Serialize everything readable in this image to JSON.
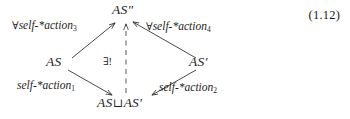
{
  "figure": {
    "kind": "commutative-diagram",
    "equation_number": "(1.12)",
    "ink_color": "#1e1e1e",
    "background_color": "#ffffff",
    "vertices": [
      {
        "id": "top",
        "text": "AS",
        "decoration": "″",
        "position": "top"
      },
      {
        "id": "left",
        "text": "AS",
        "decoration": "",
        "position": "left"
      },
      {
        "id": "right",
        "text": "AS",
        "decoration": "′",
        "position": "right"
      },
      {
        "id": "bottom",
        "text_left": "AS",
        "operator": "⊔",
        "text_right": "AS′",
        "position": "bottom"
      }
    ],
    "edges": [
      {
        "id": "top-left",
        "from": "left",
        "to": "top",
        "style": "solid",
        "quantifier": "∀",
        "label": "self-*action",
        "subscript": "3"
      },
      {
        "id": "top-right",
        "from": "right",
        "to": "top",
        "style": "solid",
        "quantifier": "∀",
        "label": "self-*action",
        "subscript": "4"
      },
      {
        "id": "bottom-left",
        "from": "left",
        "to": "bottom",
        "style": "solid",
        "quantifier": "",
        "label": "self-*action",
        "subscript": "1"
      },
      {
        "id": "bottom-right",
        "from": "right",
        "to": "bottom",
        "style": "solid",
        "quantifier": "",
        "label": "self-*action",
        "subscript": "2"
      },
      {
        "id": "mediating",
        "from": "bottom",
        "to": "top",
        "style": "dashed",
        "quantifier": "",
        "label": "∃!",
        "subscript": ""
      }
    ]
  }
}
